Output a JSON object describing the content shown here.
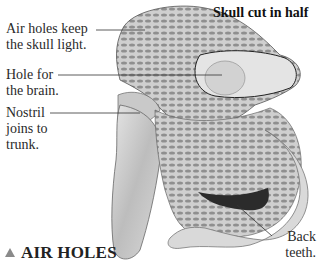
{
  "figure": {
    "title": "Skull cut in half",
    "heading": "AIR HOLES",
    "heading_icon": "triangle-up-icon",
    "labels": [
      {
        "id": "air-holes",
        "text": "Air holes keep\nthe skull light."
      },
      {
        "id": "brain-hole",
        "text": "Hole for\nthe brain."
      },
      {
        "id": "nostril",
        "text": "Nostril\njoins to\ntrunk."
      },
      {
        "id": "back-teeth",
        "text": "Back\nteeth."
      }
    ],
    "colors": {
      "accent_triangle": "#8a8a8a",
      "text": "#2a2a2a"
    }
  }
}
